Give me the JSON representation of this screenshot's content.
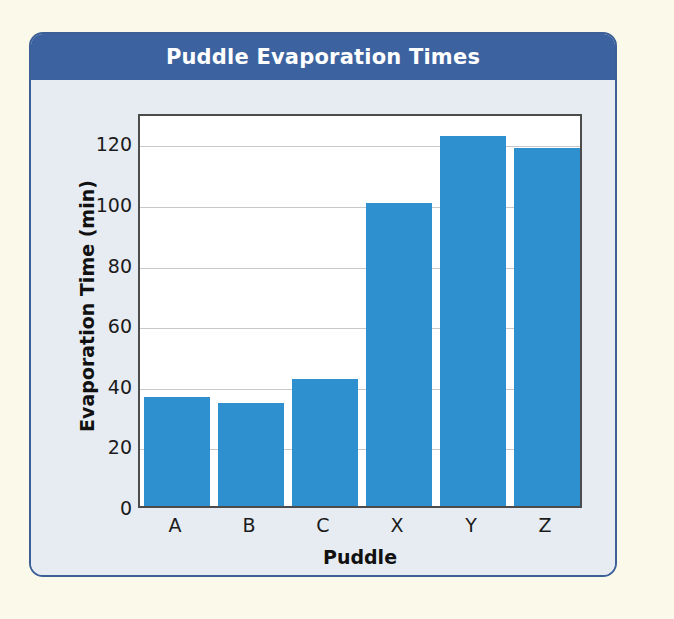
{
  "card": {
    "title": "Puddle Evaporation Times",
    "header_color": "#3c63a0",
    "border_color": "#3b5f96",
    "body_color": "#e7ecf2"
  },
  "page": {
    "background_color": "#fbfaea"
  },
  "chart_data": {
    "type": "bar",
    "title": "Puddle Evaporation Times",
    "xlabel": "Puddle",
    "ylabel": "Evaporation Time (min)",
    "categories": [
      "A",
      "B",
      "C",
      "X",
      "Y",
      "Z"
    ],
    "values": [
      36,
      34,
      42,
      100,
      122,
      118
    ],
    "series": [
      {
        "name": "Evaporation Time (min)",
        "values": [
          36,
          34,
          42,
          100,
          122,
          118
        ]
      }
    ],
    "ylim": [
      0,
      130
    ],
    "yticks": [
      0,
      20,
      40,
      60,
      80,
      100,
      120
    ],
    "ytick_labels": [
      "0",
      "20",
      "40",
      "60",
      "80",
      "100",
      "120"
    ],
    "xtick_labels": [
      "A",
      "B",
      "C",
      "X",
      "Y",
      "Z"
    ],
    "grid": true,
    "grid_axis": "y",
    "legend": false,
    "legend_position": "none",
    "bar_color": "#2e90ce",
    "plot_background": "#ffffff",
    "axis_color": "#4c4c4c",
    "gridline_color": "#c9c9c9"
  }
}
